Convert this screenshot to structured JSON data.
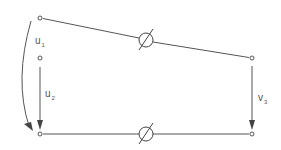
{
  "diagram": {
    "colors": {
      "wire": "#555555",
      "meter": "#444444",
      "label": "#555555",
      "background": "#ffffff"
    },
    "terminals": [
      {
        "id": "top-left",
        "x": 40,
        "y": 18
      },
      {
        "id": "middle-left",
        "x": 40,
        "y": 58
      },
      {
        "id": "bottom-left",
        "x": 40,
        "y": 134
      },
      {
        "id": "top-right",
        "x": 252,
        "y": 58
      },
      {
        "id": "bottom-right",
        "x": 252,
        "y": 134
      }
    ],
    "meters": [
      {
        "id": "top-meter",
        "cx": 146,
        "cy": 40,
        "r": 7
      },
      {
        "id": "bottom-meter",
        "cx": 146,
        "cy": 134,
        "r": 7
      }
    ],
    "labels": {
      "u1": {
        "main": "u",
        "sub": "1"
      },
      "u2": {
        "main": "u",
        "sub": "2"
      },
      "v3": {
        "main": "v",
        "sub": "3"
      }
    }
  }
}
